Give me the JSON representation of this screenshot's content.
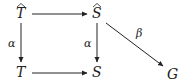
{
  "diagram": {
    "type": "commutative-diagram",
    "nodes": {
      "T_hat": {
        "label": "T",
        "accent": "hat",
        "x": 21,
        "y": 14
      },
      "S_hat": {
        "label": "S",
        "accent": "hat",
        "x": 97,
        "y": 14
      },
      "T": {
        "label": "T",
        "x": 21,
        "y": 73
      },
      "S": {
        "label": "S",
        "x": 97,
        "y": 73
      },
      "G": {
        "label": "G",
        "x": 174,
        "y": 73
      }
    },
    "edges": [
      {
        "from": "T_hat",
        "to": "S_hat",
        "label": ""
      },
      {
        "from": "T_hat",
        "to": "T",
        "label": "α"
      },
      {
        "from": "S_hat",
        "to": "S",
        "label": "α"
      },
      {
        "from": "T",
        "to": "S",
        "label": ""
      },
      {
        "from": "S_hat",
        "to": "G",
        "label": "β"
      }
    ],
    "colors": {
      "ink": "#222222"
    }
  }
}
